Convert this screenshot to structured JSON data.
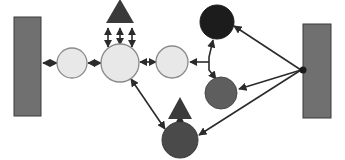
{
  "diagram": {
    "canvas": {
      "width": 345,
      "height": 160,
      "background": "#ffffff"
    },
    "palette": {
      "wall_fill": "#707070",
      "wall_stroke": "#3a3a3a",
      "node_light_fill": "#e8e8e8",
      "node_light_stroke": "#8a8a8a",
      "node_black_fill": "#1c1c1c",
      "node_darkgray_fill": "#4a4a4a",
      "node_mediumgray_fill": "#5e5e5e",
      "triangle_fill": "#3a3a3a",
      "edge_stroke": "#2b2b2b"
    },
    "walls": [
      {
        "id": "wall-left",
        "label": "left-wall",
        "x": 14,
        "y": 17,
        "width": 27,
        "height": 99,
        "fill": "#707070"
      },
      {
        "id": "wall-right",
        "label": "right-wall",
        "x": 303,
        "y": 24,
        "width": 28,
        "height": 94,
        "fill": "#707070"
      }
    ],
    "nodes": [
      {
        "id": "n1",
        "label": "light-node-1",
        "cx": 72,
        "cy": 63,
        "r": 15,
        "fill": "#e8e8e8",
        "stroke": "#8a8a8a",
        "kind": "light"
      },
      {
        "id": "n2",
        "label": "light-node-2",
        "cx": 120,
        "cy": 63,
        "r": 19,
        "fill": "#e8e8e8",
        "stroke": "#8a8a8a",
        "kind": "light"
      },
      {
        "id": "n3",
        "label": "light-node-3",
        "cx": 172,
        "cy": 62,
        "r": 16,
        "fill": "#e8e8e8",
        "stroke": "#8a8a8a",
        "kind": "light"
      },
      {
        "id": "n4",
        "label": "black-node-top-right",
        "cx": 217,
        "cy": 22,
        "r": 17,
        "fill": "#1c1c1c",
        "stroke": "#1c1c1c",
        "kind": "black"
      },
      {
        "id": "n5",
        "label": "gray-node-right",
        "cx": 221,
        "cy": 93,
        "r": 16,
        "fill": "#5e5e5e",
        "stroke": "#4a4a4a",
        "kind": "medium"
      },
      {
        "id": "n6",
        "label": "dark-node-bottom",
        "cx": 180,
        "cy": 140,
        "r": 18,
        "fill": "#4a4a4a",
        "stroke": "#3a3a3a",
        "kind": "dark"
      }
    ],
    "triangles": [
      {
        "id": "t1",
        "label": "triangle-top",
        "cx": 120,
        "cy": 11,
        "half_width": 14,
        "height": 24,
        "fill": "#3a3a3a"
      },
      {
        "id": "t2",
        "label": "triangle-bottom",
        "cx": 180,
        "cy": 108,
        "half_width": 12,
        "height": 22,
        "fill": "#3a3a3a"
      }
    ],
    "edges": [
      {
        "id": "e1",
        "label": "wall-left-to-node-1",
        "x1": 43,
        "y1": 63,
        "x2": 56,
        "y2": 63,
        "arrows": "both"
      },
      {
        "id": "e2",
        "label": "node-1-to-node-2",
        "x1": 88,
        "y1": 63,
        "x2": 100,
        "y2": 63,
        "arrows": "both"
      },
      {
        "id": "e3",
        "label": "node-2-to-node-3",
        "x1": 140,
        "y1": 62,
        "x2": 155,
        "y2": 62,
        "arrows": "both"
      },
      {
        "id": "e4",
        "label": "branch-to-node-3",
        "x1": 209,
        "y1": 62,
        "x2": 189,
        "y2": 62,
        "arrows": "end"
      },
      {
        "id": "e5",
        "label": "branch-vertical",
        "x1": 209,
        "y1": 62,
        "x2": 209,
        "y2": 62,
        "arrows": "none"
      },
      {
        "id": "e6",
        "label": "branch-up-to-black-node",
        "x1": 209,
        "y1": 60,
        "x2": 214,
        "y2": 41,
        "arrows": "end"
      },
      {
        "id": "e7",
        "label": "branch-down-to-gray-node",
        "x1": 209,
        "y1": 64,
        "x2": 216,
        "y2": 78,
        "arrows": "end"
      },
      {
        "id": "e8",
        "label": "wall-right-to-black-node",
        "x1": 301,
        "y1": 70,
        "x2": 233,
        "y2": 25,
        "arrows": "end"
      },
      {
        "id": "e9",
        "label": "wall-right-to-gray-node",
        "x1": 301,
        "y1": 70,
        "x2": 238,
        "y2": 90,
        "arrows": "end"
      },
      {
        "id": "e10",
        "label": "wall-right-to-dark-node",
        "x1": 301,
        "y1": 70,
        "x2": 198,
        "y2": 136,
        "arrows": "end"
      },
      {
        "id": "e11",
        "label": "node-2-to-dark-node",
        "x1": 131,
        "y1": 79,
        "x2": 166,
        "y2": 130,
        "arrows": "both"
      },
      {
        "id": "e12",
        "label": "triangle-bottom-to-dark-node",
        "x1": 180,
        "y1": 114,
        "x2": 180,
        "y2": 123,
        "arrows": "both"
      },
      {
        "id": "e13",
        "label": "triangle-top-to-node-2-left",
        "x1": 108,
        "y1": 27,
        "x2": 108,
        "y2": 47,
        "arrows": "both"
      },
      {
        "id": "e14",
        "label": "triangle-top-to-node-2-center",
        "x1": 120,
        "y1": 27,
        "x2": 120,
        "y2": 45,
        "arrows": "both"
      },
      {
        "id": "e15",
        "label": "triangle-top-to-node-2-right",
        "x1": 132,
        "y1": 27,
        "x2": 132,
        "y2": 47,
        "arrows": "both"
      }
    ],
    "junction": {
      "id": "j1",
      "label": "right-wall-junction",
      "cx": 303,
      "cy": 70,
      "r": 3.5,
      "fill": "#1c1c1c"
    }
  }
}
